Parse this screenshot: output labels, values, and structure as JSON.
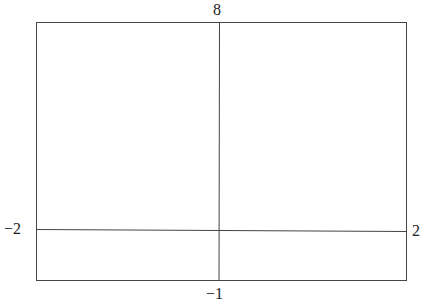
{
  "diagram": {
    "type": "line-intersection",
    "labels": {
      "top": "8",
      "bottom": "−1",
      "left": "−2",
      "right": "2"
    },
    "lines": {
      "vertical": {
        "from_label": "8",
        "to_label": "−1"
      },
      "horizontal": {
        "from_label": "−2",
        "to_label": "2"
      }
    },
    "colors": {
      "line": "#444444",
      "text": "#222222",
      "background": "#ffffff"
    }
  }
}
